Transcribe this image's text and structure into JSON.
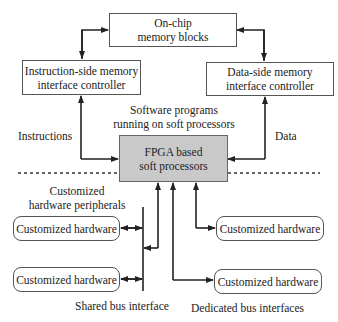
{
  "diagram": {
    "nodes": {
      "onchip_memory": "On-chip\nmemory blocks",
      "instruction_controller": "Instruction-side memory\ninterface controller",
      "data_controller": "Data-side memory\ninterface controller",
      "fpga_processors": "FPGA based\nsoft processors",
      "hw_left_1": "Customized hardware",
      "hw_left_2": "Customized hardware",
      "hw_right_1": "Customized hardware",
      "hw_right_2": "Customized hardware"
    },
    "labels": {
      "software_programs": "Software programs\nrunning on soft processors",
      "instructions": "Instructions",
      "data": "Data",
      "peripherals": "Customized\nhardware peripherals",
      "shared_bus": "Shared bus interface",
      "dedicated_bus": "Dedicated bus interfaces"
    },
    "colors": {
      "processor_fill": "#c9c9c9",
      "line": "#222222"
    }
  }
}
